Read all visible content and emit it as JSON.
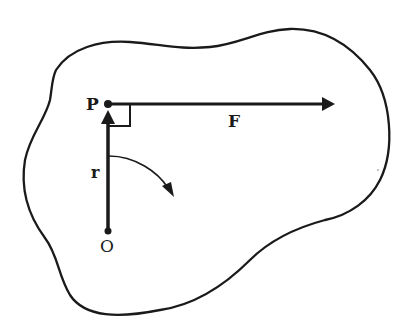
{
  "figure": {
    "colors": {
      "ink": "#1a1a1a",
      "background": "#ffffff"
    },
    "labels": {
      "point_p": "P",
      "force": "F",
      "position_vector": "r",
      "origin": "O"
    },
    "elements": {
      "body_outline": "irregular closed blob",
      "position_vector": {
        "from": "O",
        "to": "P",
        "direction": "up"
      },
      "force_vector": {
        "at": "P",
        "direction": "right"
      },
      "right_angle_marker": true,
      "rotation_arrow": "clockwise curved arrow"
    }
  }
}
